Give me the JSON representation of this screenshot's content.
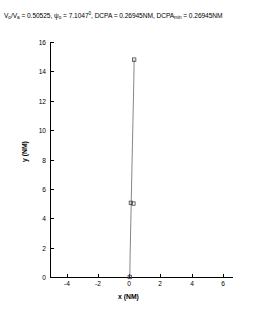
{
  "figure": {
    "title_parts": {
      "v_ratio_label": "V",
      "v_ratio_sub_o": "o",
      "v_ratio_slash": "/V",
      "v_ratio_sub_a": "a",
      "v_ratio_eq": " = 0.50525, ",
      "psi_label": "ψ",
      "psi_sub": "o",
      "psi_eq": " = 7.1047",
      "psi_deg": "0",
      "dcpa_label": ", DCPA = 0.26945NM, DCPA",
      "dcpa_sub": "min",
      "dcpa_eq": " = 0.26945NM"
    },
    "title_plain": "V_o/V_a = 0.50525, ψ_o = 7.1047°, DCPA = 0.26945NM, DCPA_min = 0.26945NM"
  },
  "chart_data": {
    "type": "line",
    "xlabel": "x (NM)",
    "ylabel": "y (NM)",
    "xlim": [
      -5.1,
      6.6
    ],
    "ylim": [
      0,
      16
    ],
    "xticks": [
      -4,
      -2,
      0,
      2,
      4,
      6
    ],
    "xticklabels": [
      "-4",
      "-2",
      "0",
      "2",
      "4",
      "6"
    ],
    "yticks": [
      0,
      2,
      4,
      6,
      8,
      10,
      12,
      14,
      16
    ],
    "yticklabels": [
      "0",
      "2",
      "4",
      "6",
      "8",
      "10",
      "12",
      "14",
      "16"
    ],
    "grid": false,
    "legend": "none",
    "line_color": "#555555",
    "marker_color": "#444444",
    "marker": "square",
    "series": [
      {
        "name": "trajectory",
        "x": [
          0.03,
          0.05,
          0.08,
          0.11,
          0.14,
          0.17,
          0.2,
          0.23,
          0.26,
          0.29,
          0.31
        ],
        "y": [
          0.0,
          1.5,
          3.0,
          4.5,
          6.0,
          7.5,
          9.0,
          10.5,
          12.0,
          13.5,
          14.8
        ]
      }
    ],
    "markers": [
      {
        "label": "start",
        "x": 0.03,
        "y": 0.0
      },
      {
        "label": "mid-a",
        "x": 0.1,
        "y": 5.05
      },
      {
        "label": "mid-b",
        "x": 0.26,
        "y": 5.0
      },
      {
        "label": "end",
        "x": 0.31,
        "y": 14.8
      }
    ]
  }
}
